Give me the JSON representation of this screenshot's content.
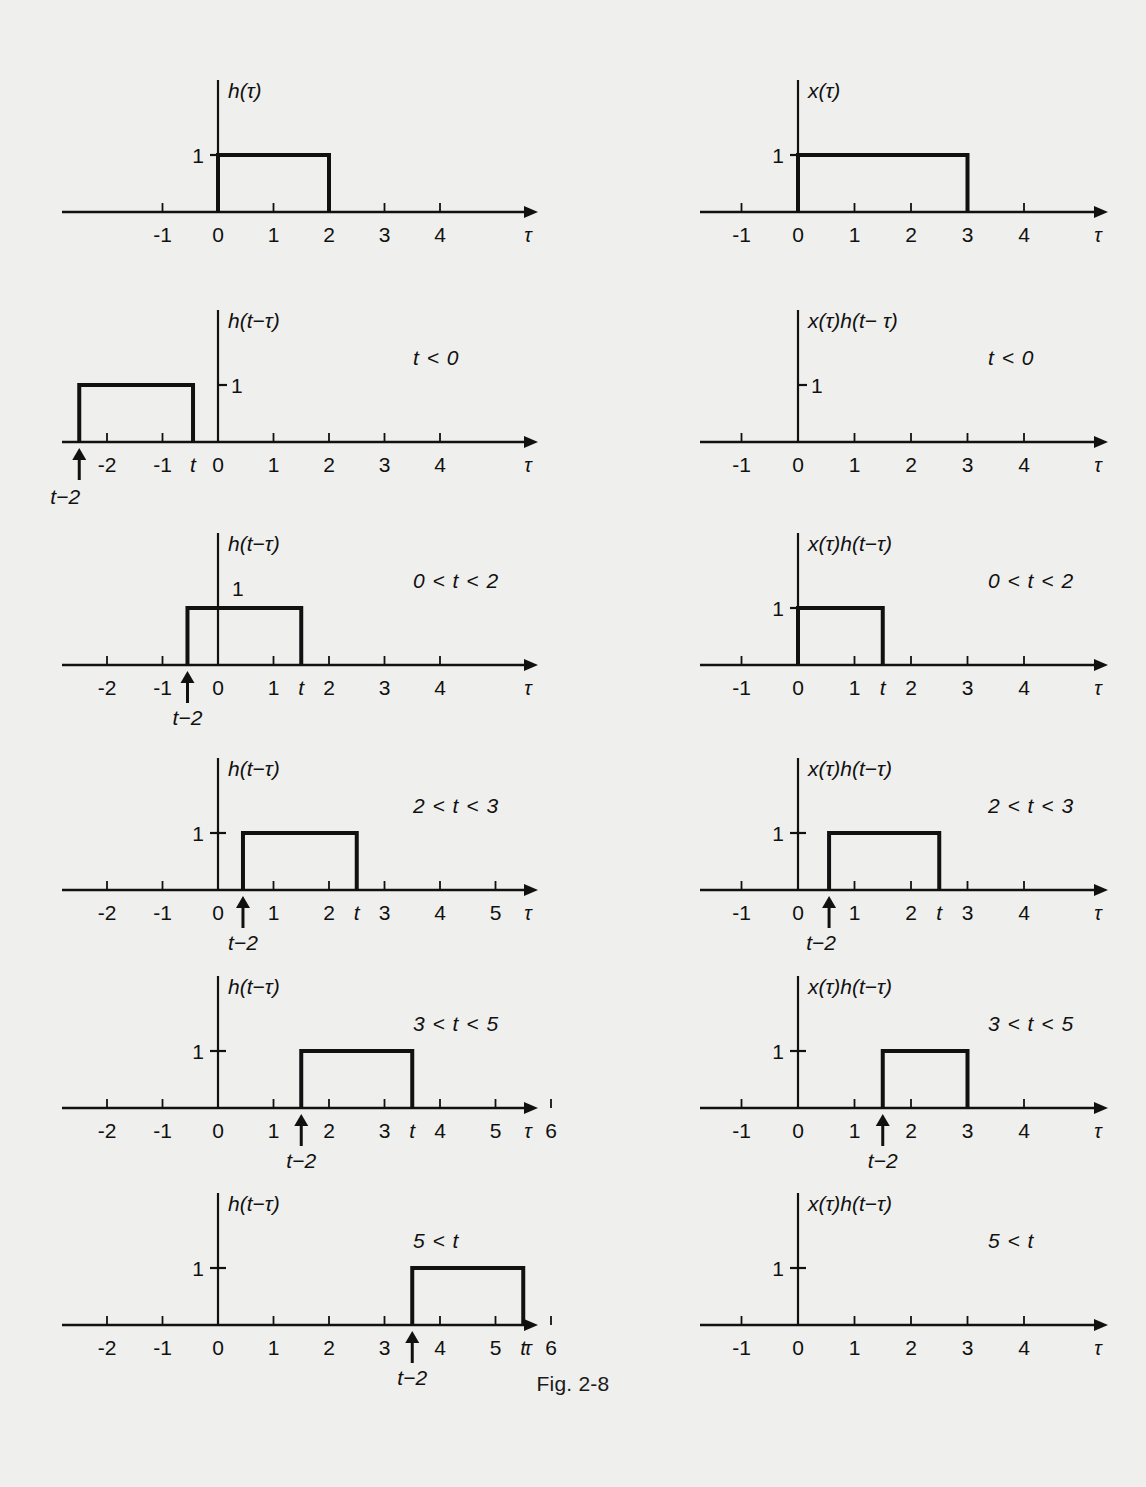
{
  "figure": {
    "caption": "Fig. 2-8",
    "corner_mark": "",
    "axis_label": "τ",
    "line_color": "#111111",
    "background": "#efefed",
    "columns": 2,
    "rows": 6
  },
  "chart_data": {
    "type": "line",
    "title": "Fig. 2-8",
    "xlabel": "τ",
    "ylabel": "",
    "grid": false,
    "legend": "none",
    "panels": [
      {
        "id": "p1-left",
        "column": "left",
        "row": 1,
        "signal_label": "h(τ)",
        "condition": "",
        "y_tick_label": "1",
        "y_tick_style": "left-of-axis",
        "xlim": [
          -2.8,
          5.6
        ],
        "ylim": [
          0,
          1.6
        ],
        "x_ticks": [
          -1,
          0,
          1,
          2,
          3,
          4
        ],
        "x_tick_labels": [
          "-1",
          "0",
          "1",
          "2",
          "3",
          "4"
        ],
        "extra_ticks": [],
        "pulse": {
          "start": 0,
          "end": 2,
          "height": 1
        },
        "arrow_marker": null
      },
      {
        "id": "p1-right",
        "column": "right",
        "row": 1,
        "signal_label": "x(τ)",
        "condition": "",
        "y_tick_label": "1",
        "y_tick_style": "left-of-axis",
        "xlim": [
          -1.75,
          5.3
        ],
        "ylim": [
          0,
          1.6
        ],
        "x_ticks": [
          -1,
          0,
          1,
          2,
          3,
          4
        ],
        "x_tick_labels": [
          "-1",
          "0",
          "1",
          "2",
          "3",
          "4"
        ],
        "extra_ticks": [],
        "pulse": {
          "start": 0,
          "end": 3,
          "height": 1
        },
        "arrow_marker": null
      },
      {
        "id": "p2-left",
        "column": "left",
        "row": 2,
        "signal_label": "h(t−τ)",
        "condition": "t < 0",
        "y_tick_label": "1",
        "y_tick_style": "right-of-axis",
        "xlim": [
          -2.8,
          5.6
        ],
        "ylim": [
          0,
          1.6
        ],
        "x_ticks": [
          -2,
          -1,
          0,
          1,
          2,
          3,
          4
        ],
        "x_tick_labels": [
          "-2",
          "-1",
          "0",
          "1",
          "2",
          "3",
          "4"
        ],
        "extra_ticks": [
          {
            "x": -0.45,
            "label": "t"
          }
        ],
        "pulse": {
          "start": -2.5,
          "end": -0.45,
          "height": 1
        },
        "arrow_marker": {
          "x": -2.5,
          "label": "t−2",
          "label_offset_x": -14,
          "two_line": true
        }
      },
      {
        "id": "p2-right",
        "column": "right",
        "row": 2,
        "signal_label": "x(τ)h(t− τ)",
        "condition": "t < 0",
        "y_tick_label": "1",
        "y_tick_style": "right-of-axis",
        "xlim": [
          -1.75,
          5.3
        ],
        "ylim": [
          0,
          1.6
        ],
        "x_ticks": [
          -1,
          0,
          1,
          2,
          3,
          4
        ],
        "x_tick_labels": [
          "-1",
          "0",
          "1",
          "2",
          "3",
          "4"
        ],
        "extra_ticks": [],
        "pulse": null,
        "arrow_marker": null
      },
      {
        "id": "p3-left",
        "column": "left",
        "row": 3,
        "signal_label": "h(t−τ)",
        "condition": "0 < t < 2",
        "y_tick_label": "1",
        "y_tick_style": "left-of-axis-high",
        "xlim": [
          -2.8,
          5.6
        ],
        "ylim": [
          0,
          1.6
        ],
        "x_ticks": [
          -2,
          -1,
          0,
          1,
          2,
          3,
          4
        ],
        "x_tick_labels": [
          "-2",
          "-1",
          "0",
          "1",
          "2",
          "3",
          "4"
        ],
        "extra_ticks": [
          {
            "x": 1.5,
            "label": "t"
          }
        ],
        "pulse": {
          "start": -0.55,
          "end": 1.5,
          "height": 1
        },
        "arrow_marker": {
          "x": -0.55,
          "label": "t−2",
          "label_offset_x": 0,
          "two_line": false
        }
      },
      {
        "id": "p3-right",
        "column": "right",
        "row": 3,
        "signal_label": "x(τ)h(t−τ)",
        "condition": "0 < t < 2",
        "y_tick_label": "1",
        "y_tick_style": "left-of-axis",
        "xlim": [
          -1.75,
          5.3
        ],
        "ylim": [
          0,
          1.6
        ],
        "x_ticks": [
          -1,
          0,
          1,
          2,
          3,
          4
        ],
        "x_tick_labels": [
          "-1",
          "0",
          "1",
          "2",
          "3",
          "4"
        ],
        "extra_ticks": [
          {
            "x": 1.5,
            "label": "t"
          }
        ],
        "pulse": {
          "start": 0,
          "end": 1.5,
          "height": 1
        },
        "arrow_marker": null
      },
      {
        "id": "p4-left",
        "column": "left",
        "row": 4,
        "signal_label": "h(t−τ)",
        "condition": "2 < t < 3",
        "y_tick_label": "1",
        "y_tick_style": "left-of-axis",
        "xlim": [
          -2.8,
          5.6
        ],
        "ylim": [
          0,
          1.6
        ],
        "x_ticks": [
          -2,
          -1,
          0,
          1,
          2,
          3,
          4,
          5
        ],
        "x_tick_labels": [
          "-2",
          "-1",
          "0",
          "1",
          "2",
          "3",
          "4",
          "5"
        ],
        "extra_ticks": [
          {
            "x": 2.5,
            "label": "t"
          }
        ],
        "pulse": {
          "start": 0.45,
          "end": 2.5,
          "height": 1
        },
        "arrow_marker": {
          "x": 0.45,
          "label": "t−2",
          "label_offset_x": 0,
          "two_line": false
        }
      },
      {
        "id": "p4-right",
        "column": "right",
        "row": 4,
        "signal_label": "x(τ)h(t−τ)",
        "condition": "2 < t < 3",
        "y_tick_label": "1",
        "y_tick_style": "left-of-axis",
        "xlim": [
          -1.75,
          5.3
        ],
        "ylim": [
          0,
          1.6
        ],
        "x_ticks": [
          -1,
          0,
          1,
          2,
          3,
          4
        ],
        "x_tick_labels": [
          "-1",
          "0",
          "1",
          "2",
          "3",
          "4"
        ],
        "extra_ticks": [
          {
            "x": 2.5,
            "label": "t"
          }
        ],
        "pulse": {
          "start": 0.55,
          "end": 2.5,
          "height": 1
        },
        "arrow_marker": {
          "x": 0.55,
          "label": "t−2",
          "label_offset_x": -8,
          "two_line": false
        }
      },
      {
        "id": "p5-left",
        "column": "left",
        "row": 5,
        "signal_label": "h(t−τ)",
        "condition": "3 < t < 5",
        "y_tick_label": "1",
        "y_tick_style": "left-of-axis",
        "xlim": [
          -2.8,
          6.6
        ],
        "ylim": [
          0,
          1.6
        ],
        "x_ticks": [
          -2,
          -1,
          0,
          1,
          2,
          3,
          4,
          5,
          6
        ],
        "x_tick_labels": [
          "-2",
          "-1",
          "0",
          "1",
          "2",
          "3",
          "4",
          "5",
          "6"
        ],
        "extra_ticks": [
          {
            "x": 3.5,
            "label": "t"
          }
        ],
        "pulse": {
          "start": 1.5,
          "end": 3.5,
          "height": 1
        },
        "arrow_marker": {
          "x": 1.5,
          "label": "t−2",
          "label_offset_x": 0,
          "two_line": false
        }
      },
      {
        "id": "p5-right",
        "column": "right",
        "row": 5,
        "signal_label": "x(τ)h(t−τ)",
        "condition": "3 < t < 5",
        "y_tick_label": "1",
        "y_tick_style": "left-of-axis",
        "xlim": [
          -1.75,
          5.3
        ],
        "ylim": [
          0,
          1.6
        ],
        "x_ticks": [
          -1,
          0,
          1,
          2,
          3,
          4
        ],
        "x_tick_labels": [
          "-1",
          "0",
          "1",
          "2",
          "3",
          "4"
        ],
        "extra_ticks": [],
        "pulse": {
          "start": 1.5,
          "end": 3,
          "height": 1
        },
        "arrow_marker": {
          "x": 1.5,
          "label": "t−2",
          "label_offset_x": 0,
          "two_line": false
        }
      },
      {
        "id": "p6-left",
        "column": "left",
        "row": 6,
        "signal_label": "h(t−τ)",
        "condition": "5 < t",
        "y_tick_label": "1",
        "y_tick_style": "left-of-axis",
        "xlim": [
          -2.8,
          6.6
        ],
        "ylim": [
          0,
          1.6
        ],
        "x_ticks": [
          -2,
          -1,
          0,
          1,
          2,
          3,
          4,
          5,
          6
        ],
        "x_tick_labels": [
          "-2",
          "-1",
          "0",
          "1",
          "2",
          "3",
          "4",
          "5",
          "6"
        ],
        "extra_ticks": [
          {
            "x": 5.5,
            "label": "t"
          }
        ],
        "pulse": {
          "start": 3.5,
          "end": 5.5,
          "height": 1
        },
        "arrow_marker": {
          "x": 3.5,
          "label": "t−2",
          "label_offset_x": 0,
          "two_line": false
        }
      },
      {
        "id": "p6-right",
        "column": "right",
        "row": 6,
        "signal_label": "x(τ)h(t−τ)",
        "condition": "5 < t",
        "y_tick_label": "1",
        "y_tick_style": "left-of-axis",
        "xlim": [
          -1.75,
          5.3
        ],
        "ylim": [
          0,
          1.6
        ],
        "x_ticks": [
          -1,
          0,
          1,
          2,
          3,
          4
        ],
        "x_tick_labels": [
          "-1",
          "0",
          "1",
          "2",
          "3",
          "4"
        ],
        "extra_ticks": [],
        "pulse": null,
        "arrow_marker": null
      }
    ]
  }
}
